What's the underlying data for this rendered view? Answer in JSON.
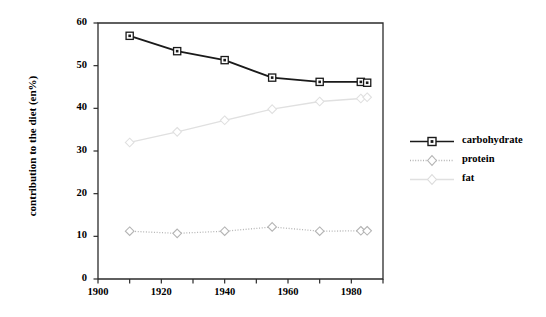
{
  "chart_data": {
    "type": "line",
    "title": "",
    "xlabel": "",
    "ylabel": "contribution to the diet (en%)",
    "xlim": [
      1900,
      1990
    ],
    "ylim": [
      0,
      60
    ],
    "yticks": [
      0,
      10,
      20,
      30,
      40,
      50,
      60
    ],
    "xticks": [
      1900,
      1910,
      1920,
      1930,
      1940,
      1950,
      1960,
      1970,
      1980,
      1990
    ],
    "xtick_labels": [
      "1900",
      "1920",
      "1940",
      "1960",
      "1980"
    ],
    "xtick_labels_values": [
      1900,
      1920,
      1940,
      1960,
      1980
    ],
    "ytick_labels": [
      "0",
      "10",
      "20",
      "30",
      "40",
      "50",
      "60"
    ],
    "grid": false,
    "legend_position": "right",
    "x": [
      1910,
      1925,
      1940,
      1955,
      1970,
      1983,
      1985
    ],
    "series": [
      {
        "name": "carbohydrate",
        "color": "#1a1a1a",
        "marker": "square",
        "linestyle": "solid",
        "values": [
          57.0,
          53.4,
          51.3,
          47.2,
          46.2,
          46.2,
          46.0
        ]
      },
      {
        "name": "protein",
        "color": "#b4b4b4",
        "marker": "diamond",
        "linestyle": "dotted",
        "values": [
          11.2,
          10.7,
          11.2,
          12.2,
          11.2,
          11.3,
          11.3
        ]
      },
      {
        "name": "fat",
        "color": "#e0e0e0",
        "marker": "diamond",
        "linestyle": "solid",
        "values": [
          32.0,
          34.5,
          37.2,
          39.8,
          41.6,
          42.3,
          42.6
        ]
      }
    ]
  },
  "legend": {
    "items": [
      {
        "label": "carbohydrate"
      },
      {
        "label": "protein"
      },
      {
        "label": "fat"
      }
    ]
  },
  "axes": {
    "y_title": "contribution to the diet (en%)"
  }
}
